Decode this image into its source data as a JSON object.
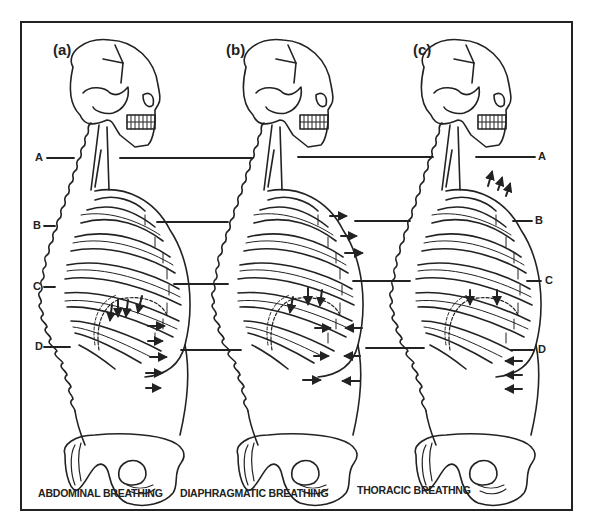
{
  "figure": {
    "panels": [
      {
        "id": "a",
        "label": "(a)",
        "caption": "ABDOMINAL BREATHING",
        "arrows": "abdomen pushed outward (right-pointing arrows below ribcage); diaphragm arrows pointing down"
      },
      {
        "id": "b",
        "label": "(b)",
        "caption": "DIAPHRAGMATIC BREATHING",
        "arrows": "upper chest outward arrows; lower abdomen opposing inward/outward arrows; diaphragm arrows pointing down"
      },
      {
        "id": "c",
        "label": "(c)",
        "caption": "THORACIC BREATHNG",
        "arrows": "upper chest arrows pointing up; abdomen inward (left-pointing) arrows; diaphragm arrows pointing down"
      }
    ],
    "levels": {
      "left": [
        "A",
        "B",
        "C",
        "D"
      ],
      "right": [
        "A",
        "B",
        "C",
        "D"
      ]
    },
    "colors": {
      "ink": "#222222",
      "background": "#ffffff"
    }
  }
}
